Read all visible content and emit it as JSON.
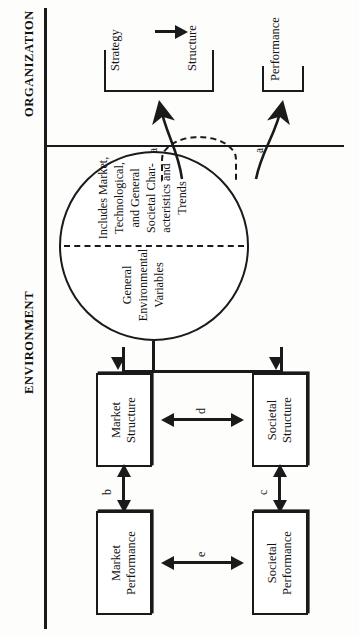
{
  "diagram": {
    "sections": {
      "environment_label": "ENVIRONMENT",
      "organization_label": "ORGANIZATION"
    },
    "boxes": [
      {
        "id": "market-performance",
        "line1": "Market",
        "line2": "Performance"
      },
      {
        "id": "societal-performance",
        "line1": "Societal",
        "line2": "Performance"
      },
      {
        "id": "market-structure",
        "line1": "Market",
        "line2": "Structure"
      },
      {
        "id": "societal-structure",
        "line1": "Societal",
        "line2": "Structure"
      }
    ],
    "circle": {
      "primary_text": "General Environmental Variables",
      "secondary_text": "Includes Market, Technological, and General Societal Char-acteristics and Trends"
    },
    "edges": [
      {
        "id": "a1",
        "label": "a"
      },
      {
        "id": "a2",
        "label": "a"
      },
      {
        "id": "b",
        "label": "b"
      },
      {
        "id": "c",
        "label": "c"
      },
      {
        "id": "d",
        "label": "d"
      },
      {
        "id": "e",
        "label": "e"
      }
    ],
    "organization": {
      "strategy_label": "Strategy",
      "structure_label": "Structure",
      "performance_label": "Performance"
    },
    "colors": {
      "ink": "#1a1a1a",
      "paper": "#fdfdfc"
    }
  }
}
